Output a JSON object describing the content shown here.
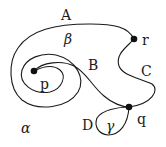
{
  "diagram": {
    "type": "planar-graph",
    "colors": {
      "stroke": "#1a1a1a",
      "vertex": "#111111",
      "background": "#ffffff"
    },
    "vertices": [
      {
        "id": "p",
        "label": "p",
        "x": 34,
        "y": 71
      },
      {
        "id": "q",
        "label": "q",
        "x": 129,
        "y": 107
      },
      {
        "id": "r",
        "label": "r",
        "x": 134,
        "y": 39
      }
    ],
    "edges": [
      {
        "id": "A",
        "label": "A",
        "from": "r",
        "to": "p",
        "description": "outer loop from r over the top, down the left side and spiraling in to p"
      },
      {
        "id": "B",
        "label": "B",
        "from": "p",
        "to": "q",
        "description": "from p spiraling outward then down to q"
      },
      {
        "id": "C",
        "label": "C",
        "from": "r",
        "to": "q",
        "description": "S-shaped curve on the right from r to q"
      },
      {
        "id": "D",
        "label": "D",
        "from": "q",
        "to": "q",
        "description": "small loop at q"
      }
    ],
    "faces": [
      {
        "id": "alpha",
        "label": "α"
      },
      {
        "id": "beta",
        "label": "β"
      },
      {
        "id": "gamma",
        "label": "γ"
      }
    ]
  }
}
